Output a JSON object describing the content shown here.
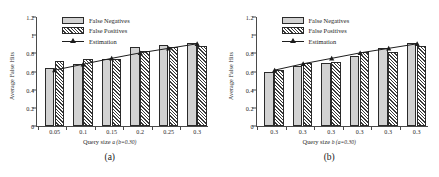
{
  "figure": {
    "panels": [
      {
        "caption": "(a)",
        "xlabel_prefix": "Query size ",
        "xlabel_var": "a",
        "xlabel_cond": "(b=0.30)",
        "ylabel": "Average False Hits"
      },
      {
        "caption": "(b)",
        "xlabel_prefix": "Query size ",
        "xlabel_var": "b",
        "xlabel_cond": "(a=0.30)",
        "ylabel": "Average False Hits"
      }
    ],
    "legend": {
      "items": [
        {
          "label": "False Negatives",
          "swatch": "solid-gray-fill",
          "color": "#d2d2d2"
        },
        {
          "label": "False Positives",
          "swatch": "diagonal-hatch-fill",
          "color": "#3a3a3a"
        },
        {
          "label": "Estimation",
          "swatch": "line-with-triangle-marker",
          "color": "#1d1d1d"
        }
      ]
    }
  },
  "chart_data": [
    {
      "type": "bar",
      "title": "(a)",
      "xlabel": "Query size a (b=0.30)",
      "ylabel": "Average False Hits",
      "categories": [
        "0.05",
        "0.1",
        "0.15",
        "0.2",
        "0.25",
        "0.3"
      ],
      "yticks": [
        "0",
        "0.2",
        "0.4",
        "0.6",
        "0.8",
        "1",
        "1.2"
      ],
      "ylim": [
        0,
        1.2
      ],
      "grid": false,
      "legend_position": "top-left-inside",
      "series": [
        {
          "name": "False Negatives",
          "type": "bar",
          "values": [
            0.635,
            0.685,
            0.735,
            0.865,
            0.895,
            0.915
          ]
        },
        {
          "name": "False Positives",
          "type": "bar",
          "values": [
            0.715,
            0.735,
            0.735,
            0.825,
            0.875,
            0.885
          ]
        },
        {
          "name": "Estimation",
          "type": "line",
          "values": [
            0.615,
            0.68,
            0.745,
            0.805,
            0.855,
            0.905
          ]
        }
      ]
    },
    {
      "type": "bar",
      "title": "(b)",
      "xlabel": "Query size b (a=0.30)",
      "ylabel": "Average False Hits",
      "categories": [
        "0.3",
        "0.3",
        "0.3",
        "0.3",
        "0.3",
        "0.3"
      ],
      "yticks": [
        "0",
        "0.2",
        "0.4",
        "0.6",
        "0.8",
        "1",
        "1.2"
      ],
      "ylim": [
        0,
        1.2
      ],
      "grid": false,
      "legend_position": "top-left-inside",
      "series": [
        {
          "name": "False Negatives",
          "type": "bar",
          "values": [
            0.59,
            0.665,
            0.695,
            0.775,
            0.855,
            0.915
          ]
        },
        {
          "name": "False Positives",
          "type": "bar",
          "values": [
            0.62,
            0.695,
            0.705,
            0.815,
            0.81,
            0.885
          ]
        },
        {
          "name": "Estimation",
          "type": "line",
          "values": [
            0.615,
            0.685,
            0.745,
            0.805,
            0.855,
            0.905
          ]
        }
      ]
    }
  ]
}
